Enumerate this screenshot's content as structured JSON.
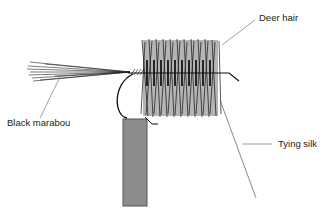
{
  "diagram": {
    "type": "fly-tying-illustration",
    "labels": {
      "deer_hair": "Deer hair",
      "black_marabou": "Black marabou",
      "tying_silk": "Tying silk"
    },
    "colors": {
      "background": "#ffffff",
      "ink": "#1a1a1a",
      "leader_line": "#777777",
      "vise_fill": "#8c8c8c",
      "vise_stroke": "#555555"
    }
  }
}
